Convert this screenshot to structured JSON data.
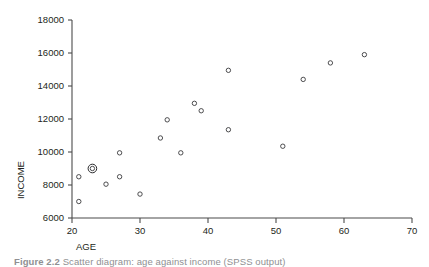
{
  "figure": {
    "caption_label": "Figure 2.2",
    "caption_text": "Scatter diagram: age against income (SPSS output)"
  },
  "chart_data": {
    "type": "scatter",
    "title": "",
    "xlabel": "AGE",
    "ylabel": "INCOME",
    "xlim": [
      20,
      70
    ],
    "ylim": [
      6000,
      18000
    ],
    "xticks": [
      20,
      30,
      40,
      50,
      60,
      70
    ],
    "yticks": [
      6000,
      8000,
      10000,
      12000,
      14000,
      16000,
      18000
    ],
    "xtick_labels": [
      "20",
      "30",
      "40",
      "50",
      "60",
      "70"
    ],
    "ytick_labels": [
      "6000",
      "8000",
      "10000",
      "12000",
      "14000",
      "16000",
      "18000"
    ],
    "grid": false,
    "legend": null,
    "marker_style": "open-circle",
    "x": [
      21,
      21,
      23,
      25,
      27,
      27,
      30,
      33,
      34,
      36,
      38,
      39,
      43,
      43,
      51,
      54,
      58,
      63
    ],
    "y": [
      8500,
      7000,
      9000,
      8050,
      9950,
      8500,
      7450,
      10850,
      11950,
      9950,
      12950,
      12500,
      14950,
      11350,
      10350,
      14400,
      15400,
      15900
    ],
    "points": [
      {
        "x": 21,
        "y": 8500,
        "highlighted": false
      },
      {
        "x": 21,
        "y": 7000,
        "highlighted": false
      },
      {
        "x": 23,
        "y": 9000,
        "highlighted": true
      },
      {
        "x": 25,
        "y": 8050,
        "highlighted": false
      },
      {
        "x": 27,
        "y": 9950,
        "highlighted": false
      },
      {
        "x": 27,
        "y": 8500,
        "highlighted": false
      },
      {
        "x": 30,
        "y": 7450,
        "highlighted": false
      },
      {
        "x": 33,
        "y": 10850,
        "highlighted": false
      },
      {
        "x": 34,
        "y": 11950,
        "highlighted": false
      },
      {
        "x": 36,
        "y": 9950,
        "highlighted": false
      },
      {
        "x": 38,
        "y": 12950,
        "highlighted": false
      },
      {
        "x": 39,
        "y": 12500,
        "highlighted": false
      },
      {
        "x": 43,
        "y": 14950,
        "highlighted": false
      },
      {
        "x": 43,
        "y": 11350,
        "highlighted": false
      },
      {
        "x": 51,
        "y": 10350,
        "highlighted": false
      },
      {
        "x": 54,
        "y": 14400,
        "highlighted": false
      },
      {
        "x": 58,
        "y": 15400,
        "highlighted": false
      },
      {
        "x": 63,
        "y": 15900,
        "highlighted": false
      }
    ],
    "colors": {
      "marker": "#3a3a3c",
      "axis": "#4b4b4b",
      "text": "#231f20",
      "caption": "#8f8f92",
      "background": "#ffffff"
    }
  }
}
